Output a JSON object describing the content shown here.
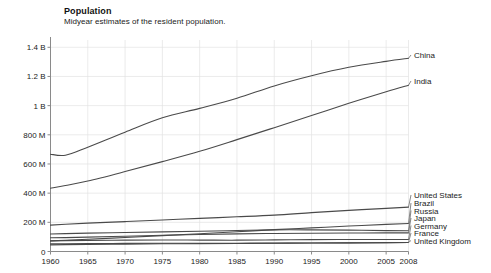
{
  "header": {
    "title": "Population",
    "subtitle": "Midyear estimates of the resident population."
  },
  "chart_data": {
    "type": "line",
    "title": "Population",
    "subtitle": "Midyear estimates of the resident population.",
    "xlabel": "",
    "ylabel": "",
    "grid": true,
    "legend_position": "right-inline-labels",
    "xlim": [
      1960,
      2008
    ],
    "ylim": [
      0,
      1450000000
    ],
    "ytick_labels": [
      "0",
      "200 M",
      "400 M",
      "600 M",
      "800 M",
      "1 B",
      "1.2 B",
      "1.4 B"
    ],
    "ytick_values": [
      0,
      200000000,
      400000000,
      600000000,
      800000000,
      1000000000,
      1200000000,
      1400000000
    ],
    "xtick_labels": [
      "1960",
      "1965",
      "1970",
      "1975",
      "1980",
      "1985",
      "1990",
      "1995",
      "2000",
      "2005",
      "2008"
    ],
    "xtick_values": [
      1960,
      1965,
      1970,
      1975,
      1980,
      1985,
      1990,
      1995,
      2000,
      2005,
      2008
    ],
    "x": [
      1960,
      1962,
      1965,
      1970,
      1975,
      1980,
      1985,
      1990,
      1995,
      2000,
      2005,
      2008
    ],
    "series": [
      {
        "name": "China",
        "color": "#4a4a4a",
        "values": [
          667070000,
          660330000,
          715185000,
          818315000,
          916395000,
          981235000,
          1051040000,
          1135185000,
          1204855000,
          1262645000,
          1303720000,
          1324655000
        ]
      },
      {
        "name": "India",
        "color": "#4a4a4a",
        "values": [
          434000000,
          452000000,
          483000000,
          548000000,
          616000000,
          687000000,
          767000000,
          849000000,
          932000000,
          1016000000,
          1095000000,
          1140000000
        ]
      },
      {
        "name": "United States",
        "color": "#4a4a4a",
        "values": [
          180671000,
          186538000,
          194303000,
          205052000,
          215973000,
          227225000,
          237924000,
          249623000,
          266278000,
          282172000,
          295517000,
          304375000
        ]
      },
      {
        "name": "Brazil",
        "color": "#4a4a4a",
        "values": [
          72775000,
          77200000,
          84150000,
          96030000,
          108700000,
          121740000,
          135250000,
          149650000,
          162020000,
          174425000,
          186075000,
          191972000
        ]
      },
      {
        "name": "Russia",
        "color": "#4a4a4a",
        "values": [
          119900000,
          122400000,
          126300000,
          130250000,
          134220000,
          138660000,
          143530000,
          148292000,
          148376000,
          146597000,
          143150000,
          141950000
        ]
      },
      {
        "name": "Japan",
        "color": "#4a4a4a",
        "values": [
          94090000,
          95180000,
          98880000,
          104345000,
          111570000,
          116800000,
          121050000,
          123540000,
          125440000,
          126840000,
          127770000,
          127690000
        ]
      },
      {
        "name": "Germany",
        "color": "#4a4a4a",
        "values": [
          72670000,
          74300000,
          75960000,
          78170000,
          78670000,
          78290000,
          77680000,
          79430000,
          81660000,
          82210000,
          82470000,
          82110000
        ]
      },
      {
        "name": "France",
        "color": "#4a4a4a",
        "values": [
          45670000,
          46990000,
          48760000,
          50770000,
          52700000,
          53870000,
          55280000,
          56710000,
          57840000,
          59050000,
          60990000,
          62040000
        ]
      },
      {
        "name": "United Kingdom",
        "color": "#4a4a4a",
        "values": [
          52370000,
          53290000,
          54580000,
          55630000,
          56230000,
          56330000,
          56550000,
          57240000,
          58020000,
          58890000,
          60230000,
          61390000
        ]
      }
    ],
    "annotations": [
      {
        "label": "China",
        "at_x": 2008,
        "at_y": 1324655000
      },
      {
        "label": "India",
        "at_x": 2008,
        "at_y": 1140000000
      },
      {
        "label": "United States",
        "at_x": 2008,
        "at_y": 304375000
      },
      {
        "label": "Brazil",
        "at_x": 2008,
        "at_y": 191972000
      },
      {
        "label": "Russia",
        "at_x": 2008,
        "at_y": 141950000
      },
      {
        "label": "Japan",
        "at_x": 2008,
        "at_y": 127690000
      },
      {
        "label": "Germany",
        "at_x": 2008,
        "at_y": 82110000
      },
      {
        "label": "France",
        "at_x": 2008,
        "at_y": 62040000
      },
      {
        "label": "United Kingdom",
        "at_x": 2008,
        "at_y": 61390000
      }
    ]
  }
}
